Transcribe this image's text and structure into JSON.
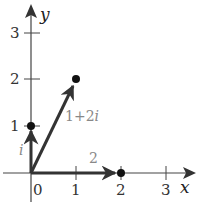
{
  "diagram": {
    "type": "complex-plane",
    "axes": {
      "x_label": "x",
      "y_label": "y",
      "x_ticks": [
        "0",
        "1",
        "2",
        "3"
      ],
      "y_ticks": [
        "1",
        "2",
        "3"
      ]
    },
    "vectors": [
      {
        "name": "i",
        "label": "i",
        "to": [
          0,
          1
        ]
      },
      {
        "name": "1+2i",
        "label": "1+2i",
        "label_parts": [
          "1+2",
          "i"
        ],
        "to": [
          1,
          2
        ]
      },
      {
        "name": "2",
        "label": "2",
        "to": [
          2,
          0
        ]
      }
    ],
    "points": [
      [
        0,
        1
      ],
      [
        1,
        2
      ],
      [
        2,
        0
      ]
    ]
  }
}
